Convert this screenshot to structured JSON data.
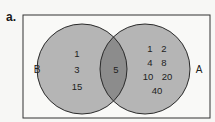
{
  "panel_label": "a.",
  "colors": {
    "background": "#f7f7f5",
    "box_stroke": "#333333",
    "circle_fill": "#b5b5b5",
    "intersection_fill": "#8c8c8c",
    "circle_stroke": "#2a2a2a"
  },
  "sets": {
    "B": {
      "label": "B",
      "only": [
        "1",
        "3",
        "15"
      ]
    },
    "A": {
      "label": "A",
      "only": [
        "1",
        "2",
        "4",
        "8",
        "10",
        "20",
        "40"
      ]
    },
    "intersection": [
      "5"
    ]
  }
}
